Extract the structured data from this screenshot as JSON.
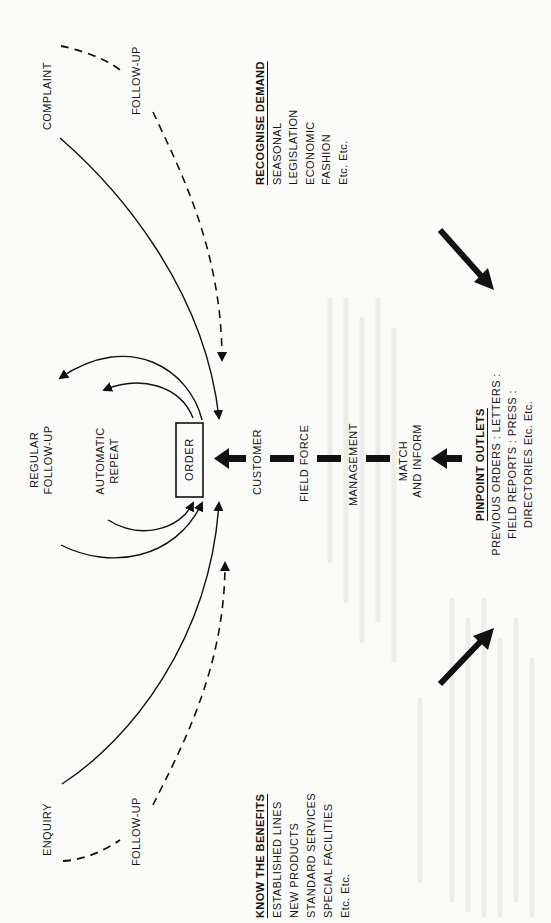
{
  "diagram": {
    "center_node": {
      "label": "ORDER"
    },
    "inbound_sources": [
      {
        "label": "COMPLAINT",
        "line": "solid"
      },
      {
        "label": "FOLLOW-UP",
        "line": "dashed",
        "position": "top"
      },
      {
        "label": "ENQUIRY",
        "line": "solid"
      },
      {
        "label": "FOLLOW-UP",
        "line": "dashed",
        "position": "bottom"
      }
    ],
    "outbound_targets": [
      {
        "label_lines": [
          "REGULAR",
          "FOLLOW-UP"
        ]
      },
      {
        "label_lines": [
          "AUTOMATIC",
          "REPEAT"
        ]
      }
    ],
    "chain": [
      {
        "label": "CUSTOMER"
      },
      {
        "label": "FIELD FORCE"
      },
      {
        "label": "MANAGEMENT"
      },
      {
        "label_lines": [
          "MATCH",
          "AND INFORM"
        ]
      }
    ],
    "panels": {
      "recognise_demand": {
        "heading": "RECOGNISE DEMAND",
        "items": [
          "SEASONAL",
          "LEGISLATION",
          "ECONOMIC",
          "FASHION",
          "Etc. Etc."
        ]
      },
      "pinpoint_outlets": {
        "heading": "PINPOINT OUTLETS",
        "lines": [
          "PREVIOUS ORDERS : LETTERS :",
          "FIELD REPORTS : PRESS :",
          "DIRECTORIES Etc. Etc."
        ]
      },
      "know_the_benefits": {
        "heading": "KNOW THE BENEFITS",
        "items": [
          "ESTABLISHED LINES",
          "NEW PRODUCTS",
          "STANDARD SERVICES",
          "SPECIAL FACILITIES",
          "Etc. Etc."
        ]
      }
    },
    "colors": {
      "ink": "#111111",
      "paper": "#fbfbfa",
      "showthrough": "#ecebe8"
    }
  }
}
